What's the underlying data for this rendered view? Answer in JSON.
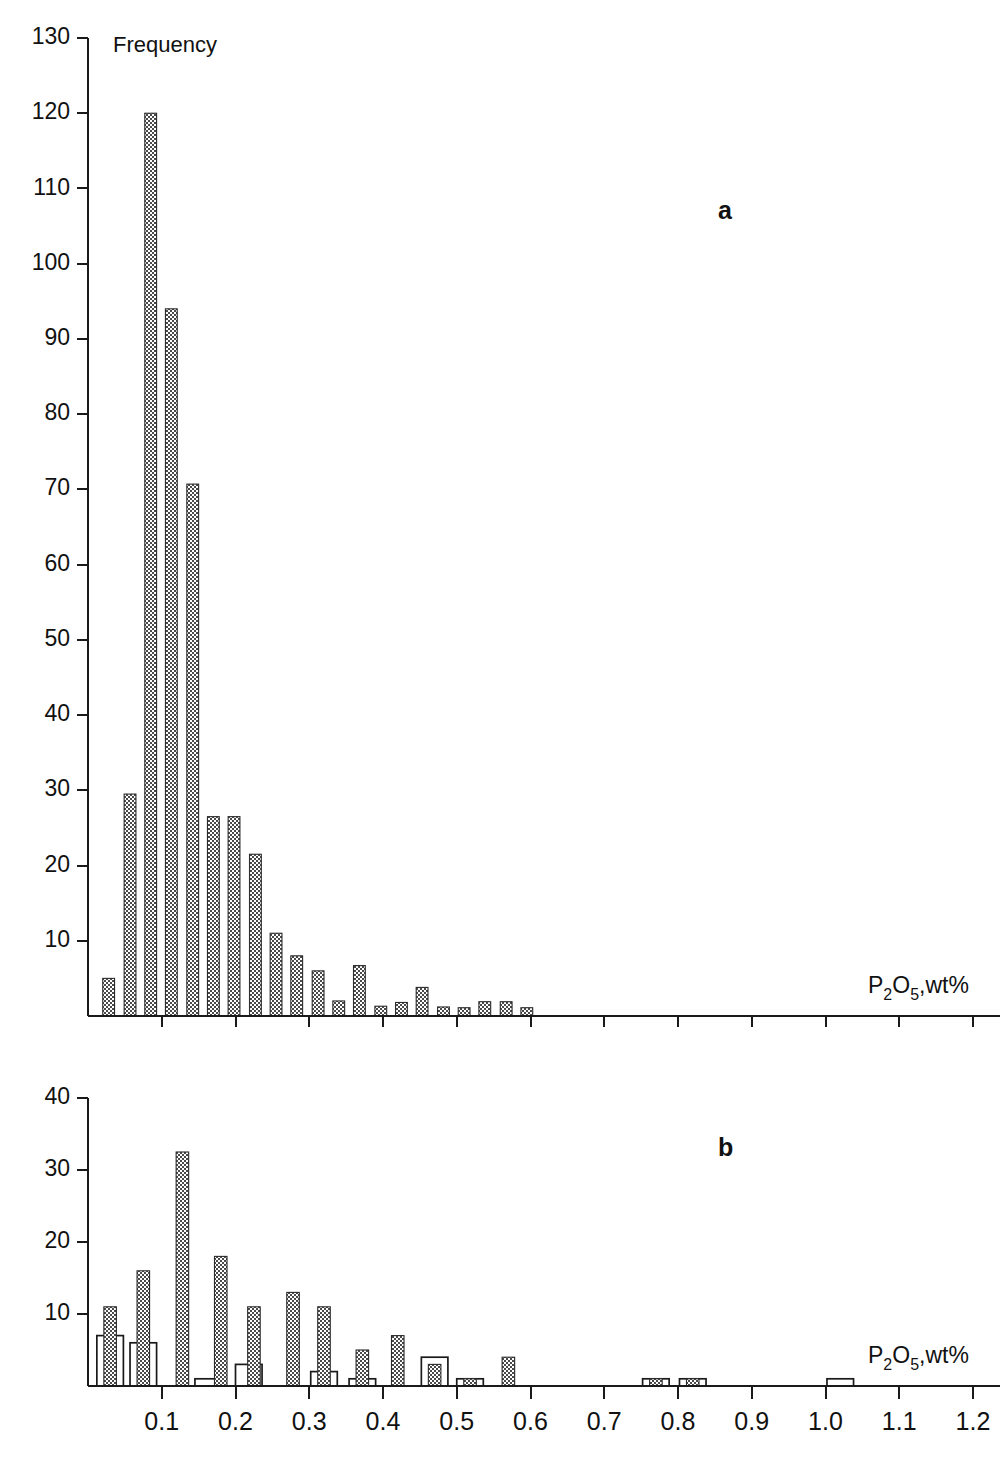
{
  "figure": {
    "y_axis_caption": "Frequency",
    "x_axis_title_main": "P",
    "x_axis_title_sub1": "2",
    "x_axis_title_mid": "O",
    "x_axis_title_sub2": "5",
    "x_axis_title_tail": ",wt%",
    "x_axis_title_plain": "P2O5,wt%",
    "panel_a_letter": "a",
    "panel_b_letter": "b",
    "colors": {
      "gray_fill": "#808080",
      "open_fill": "#ffffff",
      "axis": "#1a1a1a",
      "background": "#ffffff"
    }
  },
  "chart_data": [
    {
      "type": "bar",
      "panel": "a",
      "title": "",
      "xlabel": "P2O5,wt%",
      "ylabel": "Frequency",
      "xlim": [
        0.0,
        1.2
      ],
      "ylim": [
        0,
        130
      ],
      "ytick_labels": [
        "10",
        "20",
        "30",
        "40",
        "50",
        "60",
        "70",
        "80",
        "90",
        "100",
        "110",
        "120",
        "130"
      ],
      "ytick_values": [
        10,
        20,
        30,
        40,
        50,
        60,
        70,
        80,
        90,
        100,
        110,
        120,
        130
      ],
      "xtick_values": [
        0.1,
        0.2,
        0.3,
        0.4,
        0.5,
        0.6,
        0.7,
        0.8,
        0.9,
        1.0,
        1.1,
        1.2
      ],
      "xtick_labels": [
        "",
        "",
        "",
        "",
        "",
        "",
        "",
        "",
        "",
        "",
        "",
        ""
      ],
      "grid": false,
      "legend": "none",
      "bar_width_data": 0.016,
      "series": [
        {
          "name": "all samples",
          "style": "gray-hatched",
          "x": [
            0.028,
            0.057,
            0.085,
            0.113,
            0.142,
            0.17,
            0.198,
            0.227,
            0.255,
            0.283,
            0.312,
            0.34,
            0.368,
            0.397,
            0.425,
            0.453,
            0.482,
            0.51,
            0.538,
            0.567,
            0.595,
            0.623,
            0.652,
            0.68
          ],
          "values": [
            5,
            29.5,
            120,
            94,
            70.7,
            26.5,
            26.5,
            21.5,
            11,
            8,
            6,
            2,
            6.7,
            1.3,
            1.8,
            3.8,
            1.2,
            1.1,
            1.9,
            1.9,
            1.1,
            0,
            0,
            0
          ]
        }
      ]
    },
    {
      "type": "bar",
      "panel": "b",
      "title": "",
      "xlabel": "P2O5,wt%",
      "ylabel": "",
      "xlim": [
        0.0,
        1.2
      ],
      "ylim": [
        0,
        40
      ],
      "ytick_labels": [
        "10",
        "20",
        "30",
        "40"
      ],
      "ytick_values": [
        10,
        20,
        30,
        40
      ],
      "xtick_values": [
        0.1,
        0.2,
        0.3,
        0.4,
        0.5,
        0.6,
        0.7,
        0.8,
        0.9,
        1.0,
        1.1,
        1.2
      ],
      "xtick_labels": [
        "0.1",
        "0.2",
        "0.3",
        "0.4",
        "0.5",
        "0.6",
        "0.7",
        "0.8",
        "0.9",
        "1.0",
        "1.1",
        "1.2"
      ],
      "grid": false,
      "legend": "none",
      "bar_width_open_data": 0.036,
      "bar_width_gray_data": 0.017,
      "series": [
        {
          "name": "open",
          "style": "white-outlined",
          "x": [
            0.03,
            0.075,
            0.163,
            0.218,
            0.275,
            0.32,
            0.372,
            0.42,
            0.47,
            0.518,
            0.57,
            0.77,
            0.82,
            1.02
          ],
          "values": [
            7,
            6,
            1,
            3,
            0,
            2,
            1,
            0,
            4,
            1,
            0,
            1,
            1,
            1
          ]
        },
        {
          "name": "gray",
          "style": "gray-hatched",
          "x": [
            0.03,
            0.075,
            0.128,
            0.18,
            0.225,
            0.278,
            0.32,
            0.372,
            0.42,
            0.47,
            0.518,
            0.57,
            0.77,
            0.82
          ],
          "values": [
            11,
            16,
            32.5,
            18,
            11,
            13,
            11,
            5,
            7,
            3,
            1,
            4,
            1,
            1
          ]
        }
      ]
    }
  ]
}
